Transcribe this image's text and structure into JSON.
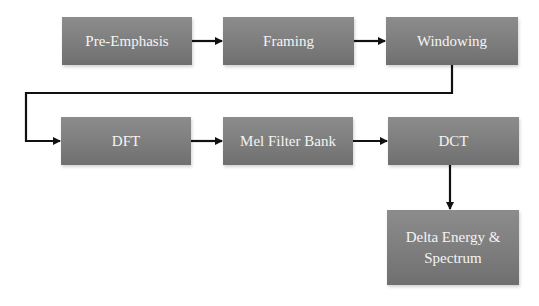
{
  "diagram": {
    "type": "flowchart",
    "title": "",
    "box_color": "#7f7f7f",
    "text_color": "#f4f4f4",
    "arrow_color": "#111111",
    "nodes": [
      {
        "id": "pre_emphasis",
        "label": "Pre-Emphasis"
      },
      {
        "id": "framing",
        "label": "Framing"
      },
      {
        "id": "windowing",
        "label": "Windowing"
      },
      {
        "id": "dft",
        "label": "DFT"
      },
      {
        "id": "mel_filter_bank",
        "label": "Mel Filter Bank"
      },
      {
        "id": "dct",
        "label": "DCT"
      },
      {
        "id": "delta",
        "label_line1": "Delta Energy &",
        "label_line2": "Spectrum"
      }
    ],
    "edges": [
      {
        "from": "pre_emphasis",
        "to": "framing"
      },
      {
        "from": "framing",
        "to": "windowing"
      },
      {
        "from": "windowing",
        "to": "dft"
      },
      {
        "from": "dft",
        "to": "mel_filter_bank"
      },
      {
        "from": "mel_filter_bank",
        "to": "dct"
      },
      {
        "from": "dct",
        "to": "delta"
      }
    ]
  }
}
